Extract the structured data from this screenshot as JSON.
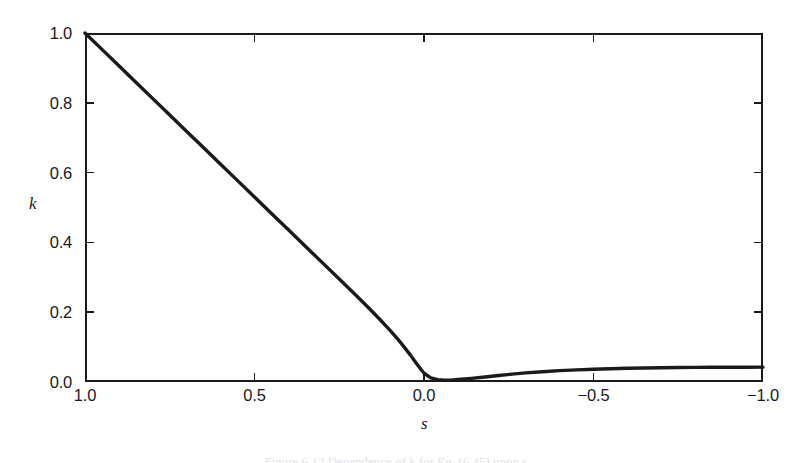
{
  "figure": {
    "background_color": "#ffffff",
    "ink_color": "#1a1a1a",
    "caption": "Figure 6.12 Dependence of k for Eq. (6.45) upon s."
  },
  "axes": {
    "x_title": "s",
    "y_title": "k"
  },
  "chart_data": {
    "type": "line",
    "title": "",
    "xlabel": "s",
    "ylabel": "k",
    "xlim": [
      1.0,
      -1.0
    ],
    "ylim": [
      0.0,
      1.0
    ],
    "x_inverted": true,
    "grid": false,
    "legend": null,
    "xticks": [
      1.0,
      0.5,
      0.0,
      -0.5,
      -1.0
    ],
    "xticklabels": [
      "1.0",
      "0.5",
      "0.0",
      "−0.5",
      "−1.0"
    ],
    "yticks": [
      0.0,
      0.2,
      0.4,
      0.6,
      0.8,
      1.0
    ],
    "yticklabels": [
      "0.0",
      "0.2",
      "0.4",
      "0.6",
      "0.8",
      "1.0"
    ],
    "series": [
      {
        "name": "k(s)",
        "color": "#1a1a1a",
        "linewidth": 3.4,
        "x": [
          1.0,
          0.95,
          0.9,
          0.85,
          0.8,
          0.75,
          0.7,
          0.65,
          0.6,
          0.55,
          0.5,
          0.45,
          0.4,
          0.35,
          0.3,
          0.25,
          0.2,
          0.16,
          0.13,
          0.1,
          0.08,
          0.06,
          0.04,
          0.02,
          0.0,
          -0.02,
          -0.04,
          -0.06,
          -0.08,
          -0.1,
          -0.14,
          -0.18,
          -0.22,
          -0.26,
          -0.3,
          -0.35,
          -0.4,
          -0.45,
          -0.5,
          -0.55,
          -0.6,
          -0.65,
          -0.7,
          -0.75,
          -0.8,
          -0.85,
          -0.9,
          -0.95,
          -1.0
        ],
        "y": [
          1.0,
          0.953,
          0.906,
          0.859,
          0.812,
          0.765,
          0.718,
          0.671,
          0.624,
          0.577,
          0.53,
          0.483,
          0.436,
          0.389,
          0.342,
          0.295,
          0.248,
          0.209,
          0.179,
          0.148,
          0.126,
          0.102,
          0.077,
          0.05,
          0.025,
          0.012,
          0.0065,
          0.005,
          0.0055,
          0.007,
          0.0105,
          0.0145,
          0.0185,
          0.0225,
          0.026,
          0.0295,
          0.0325,
          0.0348,
          0.0366,
          0.0381,
          0.0393,
          0.0402,
          0.0409,
          0.0414,
          0.0418,
          0.0421,
          0.0423,
          0.0424,
          0.0425
        ]
      }
    ],
    "annotations": [
      {
        "text": "curve starts at (s=1.0, k=1.0) and falls nearly linearly"
      },
      {
        "text": "minimum k ≈ 0.005 near s ≈ −0.05"
      },
      {
        "text": "plateau k ≈ 0.043 approaching s = −1.0"
      }
    ]
  }
}
